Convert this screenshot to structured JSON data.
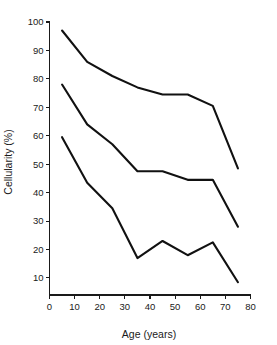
{
  "chart_data": {
    "type": "line",
    "title": "",
    "xlabel": "Age (years)",
    "ylabel": "Cellularity (%)",
    "xlim": [
      0,
      80
    ],
    "ylim": [
      4,
      100
    ],
    "xticks": [
      0,
      10,
      20,
      30,
      40,
      50,
      60,
      70,
      80
    ],
    "yticks": [
      10,
      20,
      30,
      40,
      50,
      60,
      70,
      80,
      90,
      100
    ],
    "grid": false,
    "legend": "none",
    "line_color": "#111111",
    "axis_color": "#1a1a1a",
    "x": [
      5,
      15,
      25,
      35,
      45,
      55,
      65,
      75
    ],
    "series": [
      {
        "name": "upper",
        "values": [
          97,
          86,
          81,
          77,
          74.5,
          74.5,
          70.5,
          48.5
        ]
      },
      {
        "name": "median",
        "values": [
          78,
          64,
          57,
          47.5,
          47.5,
          44.5,
          44.5,
          28
        ]
      },
      {
        "name": "lower",
        "values": [
          59.5,
          43.5,
          34.5,
          17,
          23,
          18,
          22.5,
          8.5
        ]
      }
    ]
  },
  "axes": {
    "x_title": "Age (years)",
    "y_title": "Cellularity (%)"
  }
}
